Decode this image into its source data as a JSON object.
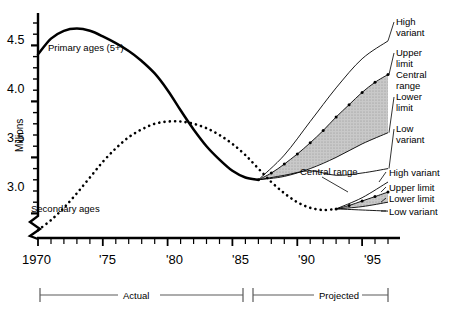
{
  "chart_data": {
    "type": "line",
    "title": "",
    "xlabel": "",
    "ylabel": "Millions",
    "xlim": [
      1970,
      1997
    ],
    "ylim": [
      2.78,
      4.78
    ],
    "grid": false,
    "axis_break": true,
    "y_ticks": [
      "3.0",
      "3.5",
      "4.0",
      "4.5"
    ],
    "y_tick_values": [
      3.0,
      3.5,
      4.0,
      4.5
    ],
    "y_minor_step": 0.1,
    "x_ticks": [
      "1970",
      "'75",
      "'80",
      "'85",
      "'90",
      "'95"
    ],
    "x_tick_values": [
      1970,
      1975,
      1980,
      1985,
      1990,
      1995
    ],
    "x_minor_step": 1,
    "series": [
      {
        "name": "Primary ages (5+)",
        "style": "solid-thick",
        "x": [
          1970,
          1971,
          1972,
          1973,
          1974,
          1975,
          1976,
          1977,
          1978,
          1979,
          1980,
          1981,
          1982,
          1983,
          1984,
          1985,
          1986,
          1987
        ],
        "values": [
          4.42,
          4.56,
          4.63,
          4.65,
          4.63,
          4.58,
          4.52,
          4.45,
          4.36,
          4.25,
          4.1,
          3.92,
          3.75,
          3.6,
          3.48,
          3.38,
          3.32,
          3.3
        ]
      },
      {
        "name": "Secondary ages",
        "style": "dotted",
        "x": [
          1970,
          1971,
          1972,
          1973,
          1974,
          1975,
          1976,
          1977,
          1978,
          1979,
          1980,
          1981,
          1982,
          1983,
          1984,
          1985,
          1986,
          1987,
          1988,
          1989,
          1990,
          1991,
          1992,
          1993
        ],
        "values": [
          2.85,
          2.94,
          3.05,
          3.18,
          3.32,
          3.46,
          3.58,
          3.68,
          3.75,
          3.8,
          3.82,
          3.82,
          3.8,
          3.76,
          3.7,
          3.62,
          3.52,
          3.4,
          3.28,
          3.18,
          3.1,
          3.05,
          3.03,
          3.04
        ]
      }
    ],
    "projections": [
      {
        "group": "Primary ages (5+)",
        "start_year": 1987,
        "start_value": 3.3,
        "bands": [
          {
            "name": "High variant",
            "style": "thin-solid",
            "x": [
              1987,
              1989,
              1991,
              1993,
              1995,
              1997
            ],
            "values": [
              3.3,
              3.52,
              3.82,
              4.12,
              4.38,
              4.54
            ]
          },
          {
            "name": "Upper limit",
            "style": "dotted-markers",
            "x": [
              1987,
              1988,
              1989,
              1990,
              1991,
              1992,
              1993,
              1994,
              1995,
              1996,
              1997
            ],
            "values": [
              3.3,
              3.36,
              3.44,
              3.53,
              3.63,
              3.74,
              3.86,
              3.97,
              4.08,
              4.17,
              4.24
            ]
          },
          {
            "name": "Lower limit",
            "style": "thin-solid",
            "x": [
              1987,
              1989,
              1991,
              1993,
              1995,
              1997
            ],
            "values": [
              3.3,
              3.33,
              3.4,
              3.5,
              3.62,
              3.72
            ]
          },
          {
            "name": "Low variant",
            "style": "thin-solid",
            "x": [
              1987,
              1989,
              1991,
              1993,
              1995,
              1997
            ],
            "values": [
              3.3,
              3.34,
              3.38,
              3.34,
              3.36,
              3.4
            ]
          }
        ],
        "shaded_band": {
          "between": [
            "Upper limit",
            "Lower limit"
          ],
          "label": "Central range",
          "fill": "#c9c9c9"
        }
      },
      {
        "group": "Secondary ages",
        "start_year": 1993,
        "start_value": 3.04,
        "bands": [
          {
            "name": "High variant",
            "style": "thin-solid",
            "x": [
              1993,
              1995,
              1997
            ],
            "values": [
              3.04,
              3.14,
              3.28
            ]
          },
          {
            "name": "Upper limit",
            "style": "dotted-markers",
            "x": [
              1993,
              1994,
              1995,
              1996,
              1997
            ],
            "values": [
              3.04,
              3.07,
              3.11,
              3.15,
              3.19
            ]
          },
          {
            "name": "Lower limit",
            "style": "thin-solid",
            "x": [
              1993,
              1995,
              1997
            ],
            "values": [
              3.04,
              3.06,
              3.1
            ]
          },
          {
            "name": "Low variant",
            "style": "thin-solid",
            "x": [
              1993,
              1995,
              1997
            ],
            "values": [
              3.04,
              3.03,
              3.02
            ]
          }
        ],
        "shaded_band": {
          "between": [
            "Upper limit",
            "Lower limit"
          ],
          "label": "Central range",
          "fill": "#c9c9c9"
        }
      }
    ]
  },
  "axis": {
    "y_title": "Millions",
    "y_labels": [
      "4.5",
      "4.0",
      "3.5",
      "3.0"
    ],
    "x_labels": [
      "1970",
      "'75",
      "'80",
      "'85",
      "'90",
      "'95"
    ]
  },
  "curve_labels": {
    "primary": "Primary ages (5+)",
    "secondary": "Secondary ages"
  },
  "annotations": {
    "central_range_callout": "Central range"
  },
  "legend_top": {
    "high_variant": "High\nvariant",
    "upper_limit": "Upper\nlimit",
    "central_range": "Central\nrange",
    "lower_limit": "Lower\nlimit",
    "low_variant": "Low\nvariant"
  },
  "legend_bottom": {
    "high_variant": "High variant",
    "upper_limit": "Upper limit",
    "lower_limit": "Lower limit",
    "low_variant": "Low variant"
  },
  "period_brackets": {
    "actual": "Actual",
    "projected": "Projected"
  },
  "colors": {
    "line": "#000000",
    "shade": "#c9c9c9",
    "bracket": "#5a5a5a",
    "background": "#ffffff"
  }
}
